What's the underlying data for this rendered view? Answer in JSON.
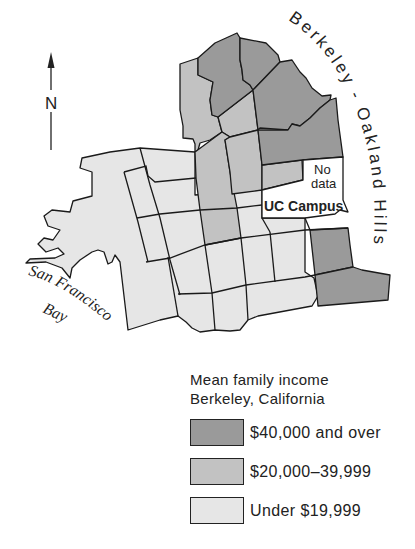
{
  "compass": {
    "label": "N",
    "icon": "north-arrow-icon"
  },
  "map_labels": {
    "hills": "Berkeley - Oakland Hills",
    "bay_line1": "San Francisco",
    "bay_line2": "Bay",
    "no_data_line1": "No",
    "no_data_line2": "data",
    "campus": "UC Campus"
  },
  "legend": {
    "title_line1": "Mean family income",
    "title_line2": "Berkeley, California",
    "items": [
      {
        "label": "$40,000 and over",
        "color": "#9a9a9a"
      },
      {
        "label": "$20,000–39,999",
        "color": "#c2c2c2"
      },
      {
        "label": "Under $19,999",
        "color": "#e6e6e6"
      }
    ]
  },
  "colors": {
    "high": "#9a9a9a",
    "mid": "#c2c2c2",
    "low": "#e6e6e6",
    "no_data": "#ffffff",
    "outline": "#1a1a1a"
  }
}
